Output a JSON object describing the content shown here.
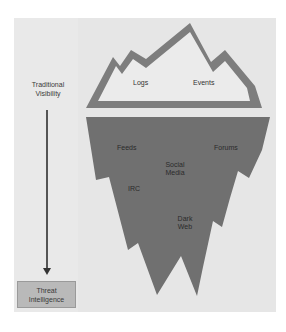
{
  "diagram": {
    "type": "iceberg",
    "colors": {
      "background": "#e6e6e6",
      "tip_outline": "#7d7d7d",
      "tip_fill": "#ebebeb",
      "submerged_fill": "#707070",
      "box_fill": "#b9b9b9",
      "arrow": "#555555"
    },
    "side": {
      "top_label_line1": "Traditional",
      "top_label_line2": "Visibility",
      "bottom_box_line1": "Threat",
      "bottom_box_line2": "Intelligence"
    },
    "tip": {
      "items": [
        "Logs",
        "Events"
      ]
    },
    "submerged": {
      "items": {
        "feeds": "Feeds",
        "forums": "Forums",
        "social_line1": "Social",
        "social_line2": "Media",
        "irc": "IRC",
        "dark_line1": "Dark",
        "dark_line2": "Web"
      }
    }
  }
}
